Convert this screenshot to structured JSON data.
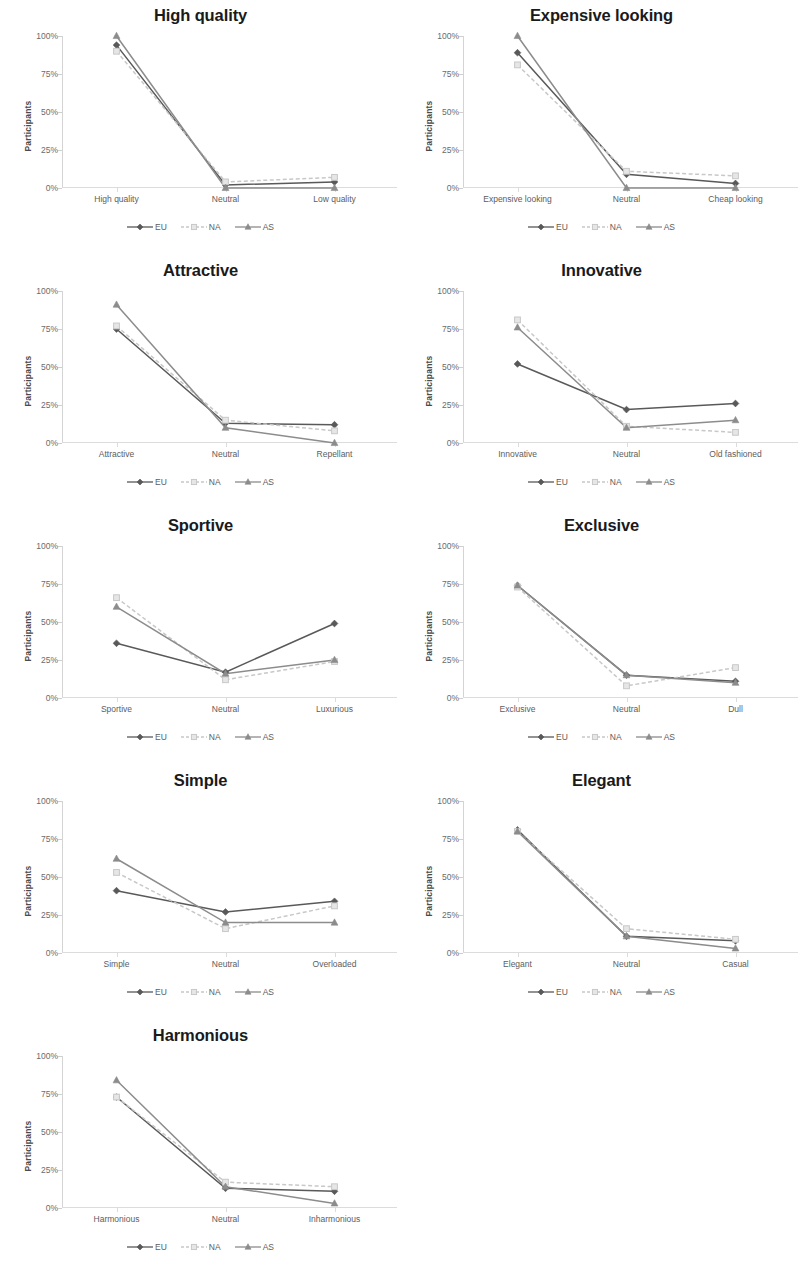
{
  "figure": {
    "ylabel": "Participants",
    "yticks": [
      "0%",
      "25%",
      "50%",
      "75%",
      "100%"
    ],
    "ytick_values": [
      0,
      25,
      50,
      75,
      100
    ],
    "ylim": [
      0,
      100
    ],
    "legend": [
      {
        "name": "EU",
        "color": "#595959",
        "marker": "diamond",
        "dash": "none"
      },
      {
        "name": "NA",
        "color": "#c8c8c8",
        "marker": "square",
        "dash": "dashed"
      },
      {
        "name": "AS",
        "color": "#8c8c8c",
        "marker": "triangle",
        "dash": "none"
      }
    ]
  },
  "chart_data": [
    {
      "type": "line",
      "title": "High quality",
      "xlabel": "",
      "ylabel": "Participants",
      "ylim": [
        0,
        100
      ],
      "grid": false,
      "legend_position": "bottom",
      "categories": [
        "High quality",
        "Neutral",
        "Low quality"
      ],
      "series": [
        {
          "name": "EU",
          "values": [
            94,
            2,
            4
          ]
        },
        {
          "name": "NA",
          "values": [
            90,
            4,
            7
          ]
        },
        {
          "name": "AS",
          "values": [
            100,
            0,
            0
          ]
        }
      ]
    },
    {
      "type": "line",
      "title": "Expensive looking",
      "xlabel": "",
      "ylabel": "Participants",
      "ylim": [
        0,
        100
      ],
      "grid": false,
      "legend_position": "bottom",
      "categories": [
        "Expensive looking",
        "Neutral",
        "Cheap looking"
      ],
      "series": [
        {
          "name": "EU",
          "values": [
            89,
            9,
            3
          ]
        },
        {
          "name": "NA",
          "values": [
            81,
            11,
            8
          ]
        },
        {
          "name": "AS",
          "values": [
            100,
            0,
            0
          ]
        }
      ]
    },
    {
      "type": "line",
      "title": "Attractive",
      "xlabel": "",
      "ylabel": "Participants",
      "ylim": [
        0,
        100
      ],
      "grid": false,
      "legend_position": "bottom",
      "categories": [
        "Attractive",
        "Neutral",
        "Repellant"
      ],
      "series": [
        {
          "name": "EU",
          "values": [
            75,
            13,
            12
          ]
        },
        {
          "name": "NA",
          "values": [
            77,
            15,
            8
          ]
        },
        {
          "name": "AS",
          "values": [
            91,
            10,
            0
          ]
        }
      ]
    },
    {
      "type": "line",
      "title": "Innovative",
      "xlabel": "",
      "ylabel": "Participants",
      "ylim": [
        0,
        100
      ],
      "grid": false,
      "legend_position": "bottom",
      "categories": [
        "Innovative",
        "Neutral",
        "Old fashioned"
      ],
      "series": [
        {
          "name": "EU",
          "values": [
            52,
            22,
            26
          ]
        },
        {
          "name": "NA",
          "values": [
            81,
            11,
            7
          ]
        },
        {
          "name": "AS",
          "values": [
            76,
            10,
            15
          ]
        }
      ]
    },
    {
      "type": "line",
      "title": "Sportive",
      "xlabel": "",
      "ylabel": "Participants",
      "ylim": [
        0,
        100
      ],
      "grid": false,
      "legend_position": "bottom",
      "categories": [
        "Sportive",
        "Neutral",
        "Luxurious"
      ],
      "series": [
        {
          "name": "EU",
          "values": [
            36,
            17,
            49
          ]
        },
        {
          "name": "NA",
          "values": [
            66,
            12,
            24
          ]
        },
        {
          "name": "AS",
          "values": [
            60,
            16,
            25
          ]
        }
      ]
    },
    {
      "type": "line",
      "title": "Exclusive",
      "xlabel": "",
      "ylabel": "Participants",
      "ylim": [
        0,
        100
      ],
      "grid": false,
      "legend_position": "bottom",
      "categories": [
        "Exclusive",
        "Neutral",
        "Dull"
      ],
      "series": [
        {
          "name": "EU",
          "values": [
            74,
            15,
            11
          ]
        },
        {
          "name": "NA",
          "values": [
            73,
            8,
            20
          ]
        },
        {
          "name": "AS",
          "values": [
            74,
            15,
            10
          ]
        }
      ]
    },
    {
      "type": "line",
      "title": "Simple",
      "xlabel": "",
      "ylabel": "Participants",
      "ylim": [
        0,
        100
      ],
      "grid": false,
      "legend_position": "bottom",
      "categories": [
        "Simple",
        "Neutral",
        "Overloaded"
      ],
      "series": [
        {
          "name": "EU",
          "values": [
            41,
            27,
            34
          ]
        },
        {
          "name": "NA",
          "values": [
            53,
            16,
            31
          ]
        },
        {
          "name": "AS",
          "values": [
            62,
            20,
            20
          ]
        }
      ]
    },
    {
      "type": "line",
      "title": "Elegant",
      "xlabel": "",
      "ylabel": "Participants",
      "ylim": [
        0,
        100
      ],
      "grid": false,
      "legend_position": "bottom",
      "categories": [
        "Elegant",
        "Neutral",
        "Casual"
      ],
      "series": [
        {
          "name": "EU",
          "values": [
            81,
            11,
            8
          ]
        },
        {
          "name": "NA",
          "values": [
            80,
            16,
            9
          ]
        },
        {
          "name": "AS",
          "values": [
            80,
            11,
            3
          ]
        }
      ]
    },
    {
      "type": "line",
      "title": "Harmonious",
      "xlabel": "",
      "ylabel": "Participants",
      "ylim": [
        0,
        100
      ],
      "grid": false,
      "legend_position": "bottom",
      "categories": [
        "Harmonious",
        "Neutral",
        "Inharmonious"
      ],
      "series": [
        {
          "name": "EU",
          "values": [
            73,
            13,
            11
          ]
        },
        {
          "name": "NA",
          "values": [
            73,
            17,
            14
          ]
        },
        {
          "name": "AS",
          "values": [
            84,
            14,
            3
          ]
        }
      ]
    }
  ]
}
